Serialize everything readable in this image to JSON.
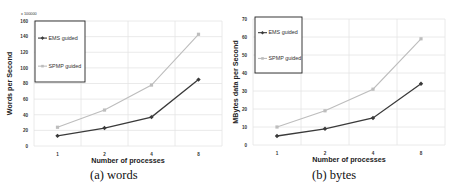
{
  "figure": {
    "captions": [
      "(a)  words",
      "(b)  bytes"
    ]
  },
  "colors": {
    "ems": "#3a3a3a",
    "spmp": "#bdbdbd",
    "grid": "#e4e4e4",
    "legend_border": "#222222",
    "axis_text": "#333333"
  },
  "chart_data": [
    {
      "type": "line",
      "title": "",
      "caption": "(a)  words",
      "xlabel": "Number of processes",
      "ylabel": "Words per Second",
      "y_multiplier_label": "x 100000",
      "categories": [
        "1",
        "2",
        "4",
        "8"
      ],
      "yticks": [
        0,
        20,
        40,
        60,
        80,
        100,
        120,
        140,
        160
      ],
      "ylim": [
        0,
        160
      ],
      "grid": true,
      "legend_position": "upper-left (boxed)",
      "series": [
        {
          "name": "EMS guided",
          "marker": "diamond",
          "values": [
            13,
            23,
            37,
            85
          ]
        },
        {
          "name": "SPMP guided",
          "marker": "square",
          "values": [
            24,
            46,
            78,
            143
          ]
        }
      ]
    },
    {
      "type": "line",
      "title": "",
      "caption": "(b)  bytes",
      "xlabel": "Number of processes",
      "ylabel": "MBytes data per Second",
      "y_multiplier_label": "",
      "categories": [
        "1",
        "2",
        "4",
        "8"
      ],
      "yticks": [
        0,
        10,
        20,
        30,
        40,
        50,
        60,
        70
      ],
      "ylim": [
        0,
        70
      ],
      "grid": true,
      "legend_position": "upper-left (boxed)",
      "series": [
        {
          "name": "EMS guided",
          "marker": "diamond",
          "values": [
            5,
            9,
            15,
            34
          ]
        },
        {
          "name": "SPMP guided",
          "marker": "square",
          "values": [
            10,
            19,
            31,
            59
          ]
        }
      ]
    }
  ],
  "layout": [
    {
      "plot": {
        "x0": 34,
        "x1": 222,
        "y0": 21,
        "y1": 146
      },
      "legend": {
        "x": 35,
        "y": 21,
        "w": 50,
        "h": 61
      },
      "ylabel_x": 10,
      "mult_x": 21,
      "mult_y": 15,
      "caption_x": 90,
      "caption_y": 170
    },
    {
      "plot": {
        "x0": 253,
        "x1": 445,
        "y0": 19,
        "y1": 145
      },
      "legend": {
        "x": 255,
        "y": 17,
        "w": 47,
        "h": 56
      },
      "ylabel_x": 236,
      "mult_x": 0,
      "mult_y": 0,
      "caption_x": 312,
      "caption_y": 170
    }
  ]
}
